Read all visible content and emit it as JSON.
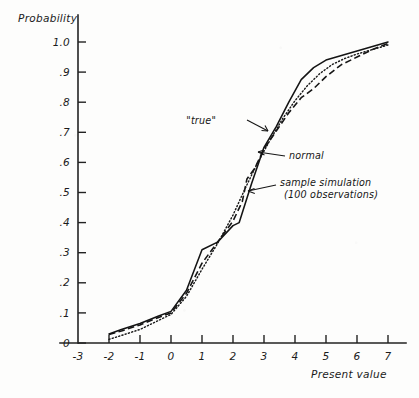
{
  "figure": {
    "title_visible": false,
    "background_color": "#fdfdfc",
    "ink_color": "#161616"
  },
  "axes": {
    "y_title": "Probability",
    "x_title": "Present value",
    "y_ticklabels": [
      "1.0",
      ".9",
      ".8",
      ".7",
      ".6",
      ".5",
      ".4",
      ".3",
      ".2",
      ".1",
      "0"
    ],
    "x_ticklabels": [
      "-3",
      "-2",
      "-1",
      "0",
      "1",
      "2",
      "3",
      "4",
      "5",
      "6",
      "7"
    ]
  },
  "annotations": {
    "true_label": "\"true\"",
    "normal_label": "normal",
    "sample_label_line1": "sample simulation",
    "sample_label_line2": "(100 observations)"
  },
  "chart_data": {
    "type": "line",
    "title": "",
    "xlabel": "Present value",
    "ylabel": "Probability",
    "xlim": [
      -3,
      7
    ],
    "ylim": [
      0,
      1.0
    ],
    "xticks": [
      -3,
      -2,
      -1,
      0,
      1,
      2,
      3,
      4,
      5,
      6,
      7
    ],
    "yticks": [
      0,
      0.1,
      0.2,
      0.3,
      0.4,
      0.5,
      0.6,
      0.7,
      0.8,
      0.9,
      1.0
    ],
    "grid": false,
    "legend_position": "inline-annotations",
    "series": [
      {
        "name": "\"true\"",
        "style": "solid",
        "x": [
          -2.0,
          -1.6,
          -1.0,
          -0.4,
          0.0,
          0.5,
          1.0,
          1.5,
          2.0,
          2.2,
          2.6,
          3.0,
          3.4,
          3.8,
          4.2,
          4.6,
          5.0,
          5.5,
          6.0,
          6.5,
          7.0
        ],
        "y": [
          0.03,
          0.045,
          0.065,
          0.09,
          0.105,
          0.175,
          0.31,
          0.335,
          0.39,
          0.4,
          0.53,
          0.65,
          0.72,
          0.8,
          0.875,
          0.915,
          0.94,
          0.955,
          0.97,
          0.985,
          1.0
        ]
      },
      {
        "name": "normal",
        "style": "dotted",
        "x": [
          -2.0,
          -1.6,
          -1.0,
          -0.4,
          0.0,
          0.5,
          1.0,
          1.5,
          2.0,
          2.4,
          2.8,
          3.2,
          3.6,
          4.0,
          4.4,
          4.8,
          5.2,
          5.6,
          6.0,
          6.5,
          7.0
        ],
        "y": [
          0.012,
          0.025,
          0.045,
          0.075,
          0.095,
          0.155,
          0.245,
          0.33,
          0.425,
          0.515,
          0.6,
          0.675,
          0.745,
          0.805,
          0.855,
          0.895,
          0.925,
          0.945,
          0.96,
          0.975,
          0.99
        ]
      },
      {
        "name": "sample simulation (100 observations)",
        "style": "dashed",
        "x": [
          -2.0,
          -1.6,
          -1.0,
          -0.4,
          0.0,
          0.5,
          1.0,
          1.5,
          2.0,
          2.3,
          2.45,
          2.7,
          3.0,
          3.4,
          3.8,
          4.2,
          4.6,
          5.0,
          5.5,
          6.0,
          6.5,
          7.0
        ],
        "y": [
          0.028,
          0.04,
          0.06,
          0.085,
          0.1,
          0.165,
          0.265,
          0.335,
          0.405,
          0.47,
          0.545,
          0.58,
          0.645,
          0.705,
          0.765,
          0.815,
          0.845,
          0.885,
          0.925,
          0.95,
          0.975,
          0.995
        ]
      }
    ]
  }
}
